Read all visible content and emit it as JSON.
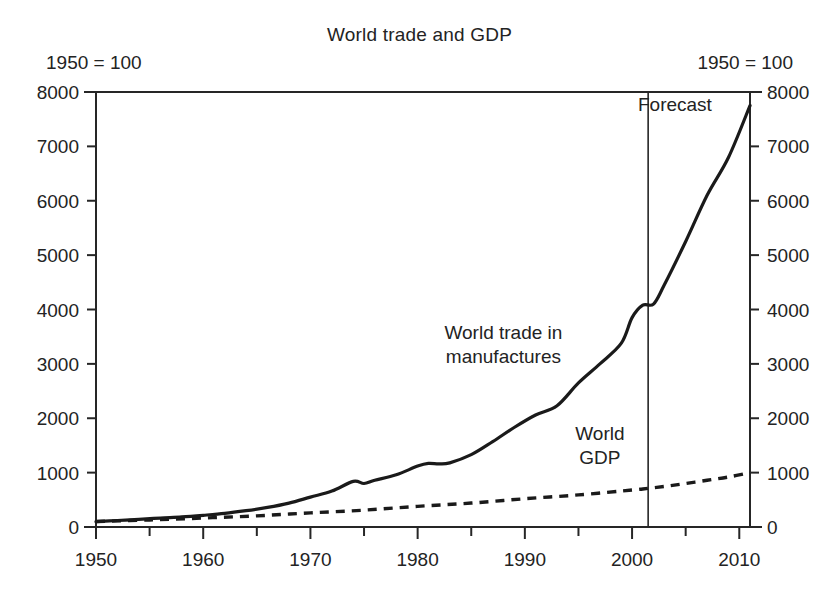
{
  "chart_data": {
    "type": "line",
    "title": "World trade and GDP",
    "units_note_left": "1950 = 100",
    "units_note_right": "1950 = 100",
    "xlabel": "",
    "ylabel": "",
    "xlim": [
      1950,
      2011
    ],
    "ylim": [
      0,
      8000
    ],
    "grid": false,
    "legend_position": "inline-annotations",
    "y_ticks_left": [
      "0",
      "1000",
      "2000",
      "3000",
      "4000",
      "5000",
      "6000",
      "7000",
      "8000"
    ],
    "y_ticks_right": [
      "0",
      "1000",
      "2000",
      "3000",
      "4000",
      "5000",
      "6000",
      "7000",
      "8000"
    ],
    "x_ticks_major": [
      "1950",
      "1960",
      "1970",
      "1980",
      "1990",
      "2000",
      "2010"
    ],
    "x_ticks_minor": [
      "1955",
      "1965",
      "1975",
      "1985",
      "1995",
      "2005"
    ],
    "y_tick_step": 1000,
    "x_tick_step_major": 10,
    "x_tick_step_minor": 5,
    "annotations": [
      {
        "text_line1": "World trade in",
        "text_line2": "manufactures",
        "x": 1988,
        "y": 3450
      },
      {
        "text_line1": "World",
        "text_line2": "GDP",
        "x": 1997,
        "y": 1600
      },
      {
        "text_line1": "Forecast",
        "text_line2": "",
        "x": 2004,
        "y": 7650
      }
    ],
    "forecast_divider_year": 2001.5,
    "series": [
      {
        "name": "World trade in manufactures",
        "style": "solid",
        "x": [
          1950,
          1952,
          1954,
          1956,
          1958,
          1960,
          1962,
          1964,
          1966,
          1968,
          1970,
          1972,
          1974,
          1975,
          1976,
          1978,
          1980,
          1981,
          1982,
          1983,
          1985,
          1987,
          1989,
          1991,
          1993,
          1995,
          1997,
          1999,
          2000,
          2001,
          2002,
          2003,
          2005,
          2007,
          2009,
          2011
        ],
        "values": [
          100,
          120,
          140,
          165,
          185,
          215,
          250,
          300,
          360,
          440,
          550,
          660,
          840,
          800,
          860,
          960,
          1120,
          1170,
          1160,
          1180,
          1330,
          1570,
          1830,
          2060,
          2230,
          2650,
          3000,
          3380,
          3850,
          4080,
          4100,
          4450,
          5250,
          6100,
          6800,
          7750
        ]
      },
      {
        "name": "World GDP",
        "style": "dashed",
        "x": [
          1950,
          1955,
          1960,
          1965,
          1970,
          1975,
          1980,
          1985,
          1990,
          1995,
          2000,
          2001,
          2003,
          2005,
          2007,
          2009,
          2011
        ],
        "values": [
          100,
          130,
          165,
          205,
          260,
          310,
          380,
          440,
          520,
          590,
          680,
          700,
          745,
          800,
          860,
          920,
          1000
        ]
      }
    ]
  },
  "axes": {
    "x_title": "",
    "y_title": ""
  }
}
